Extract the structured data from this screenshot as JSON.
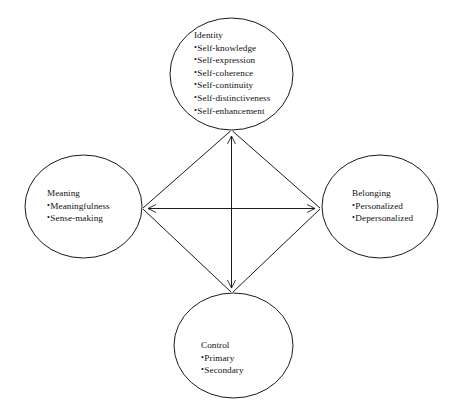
{
  "figure": {
    "type": "concept-diagram",
    "background_color": "#ffffff",
    "stroke_color": "#1a1a1a",
    "nodes": [
      {
        "id": "identity",
        "position": "top",
        "title": "Identity",
        "items": [
          "Self-knowledge",
          "Self-expression",
          "Self-coherence",
          "Self-continuity",
          "Self-distinctiveness",
          "Self-enhancement"
        ]
      },
      {
        "id": "meaning",
        "position": "left",
        "title": "Meaning",
        "items": [
          "Meaningfulness",
          "Sense-making"
        ]
      },
      {
        "id": "belonging",
        "position": "right",
        "title": "Belonging",
        "items": [
          "Personalized",
          "Depersonalized"
        ]
      },
      {
        "id": "control",
        "position": "bottom",
        "title": "Control",
        "items": [
          "Primary",
          "Secondary"
        ]
      }
    ],
    "connectors": [
      {
        "id": "diamond-top-left",
        "from": "identity",
        "to": "meaning",
        "style": "line"
      },
      {
        "id": "diamond-top-right",
        "from": "identity",
        "to": "belonging",
        "style": "line"
      },
      {
        "id": "diamond-bottom-left",
        "from": "meaning",
        "to": "control",
        "style": "line"
      },
      {
        "id": "diamond-bottom-right",
        "from": "belonging",
        "to": "control",
        "style": "line"
      },
      {
        "id": "axis-vertical",
        "from": "identity",
        "to": "control",
        "style": "double-arrow"
      },
      {
        "id": "axis-horizontal",
        "from": "meaning",
        "to": "belonging",
        "style": "double-arrow"
      }
    ]
  }
}
